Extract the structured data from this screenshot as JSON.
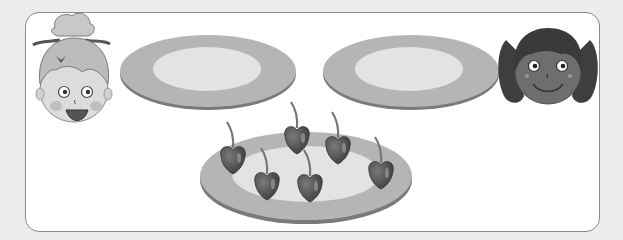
{
  "scene": {
    "description": "Grayscale illustration: two children, two empty plates, and one plate of cherries to share",
    "colors": {
      "background": "#ececec",
      "frame_fill": "#ffffff",
      "frame_border": "#8a8a8a",
      "plate_rim": "#b5b5b5",
      "plate_center": "#e3e3e3",
      "plate_edge": "#7a7a7a",
      "cherry": "#4e4e4e",
      "stem": "#777777"
    },
    "characters": [
      {
        "name": "girl-with-bun",
        "position": "left"
      },
      {
        "name": "girl-with-pigtails",
        "position": "right"
      }
    ],
    "plates": [
      {
        "name": "empty-plate-left",
        "cherries": 0
      },
      {
        "name": "empty-plate-right",
        "cherries": 0
      },
      {
        "name": "cherry-plate",
        "cherries": 6
      }
    ],
    "cherry_count": 6
  }
}
